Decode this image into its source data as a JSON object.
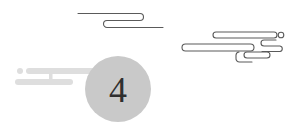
{
  "badge": {
    "number": "4"
  },
  "colors": {
    "line": "#555555",
    "bar": "#dedede",
    "circle": "#c9c9c9",
    "digit": "#2f2f2f",
    "background": "#ffffff"
  },
  "decorations": [
    {
      "name": "cloud-line-top",
      "style": "outline"
    },
    {
      "name": "cloud-lines-right",
      "style": "outline"
    },
    {
      "name": "speed-bars-left",
      "style": "filled"
    }
  ]
}
